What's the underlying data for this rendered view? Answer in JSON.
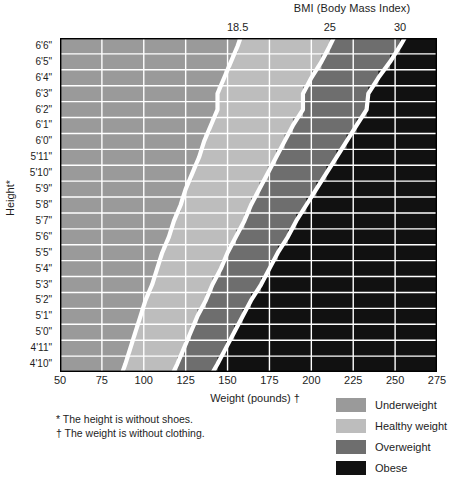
{
  "chart_data": {
    "type": "heatmap",
    "title": "BMI (Body Mass Index)",
    "xlabel": "Weight (pounds) †",
    "ylabel": "Height*",
    "xlim": [
      50,
      275
    ],
    "x_ticks": [
      50,
      75,
      100,
      125,
      150,
      175,
      200,
      225,
      250,
      275
    ],
    "x_tick_labels": [
      "50",
      "75",
      "100",
      "125",
      "150",
      "175",
      "200",
      "225",
      "250",
      "275"
    ],
    "y_tick_labels": [
      "6'6\"",
      "6'5\"",
      "6'4\"",
      "6'3\"",
      "6'2\"",
      "6'1\"",
      "6'0\"",
      "5'11\"",
      "5'10\"",
      "5'9\"",
      "5'8\"",
      "5'7\"",
      "5'6\"",
      "5'5\"",
      "5'4\"",
      "5'3\"",
      "5'2\"",
      "5'1\"",
      "5'0\"",
      "4'11\"",
      "4'10\""
    ],
    "heights_inches": [
      78,
      77,
      76,
      75,
      74,
      73,
      72,
      71,
      70,
      69,
      68,
      67,
      66,
      65,
      64,
      63,
      62,
      61,
      60,
      59,
      58
    ],
    "bmi_boundaries": [
      18.5,
      25,
      30
    ],
    "bmi_boundary_labels": [
      "18.5",
      "25",
      "30"
    ],
    "grid": true,
    "legend_position": "bottom-right",
    "categories": [
      {
        "name": "Underweight",
        "bmi_range": "< 18.5",
        "color": "#9a9a9a"
      },
      {
        "name": "Healthy weight",
        "bmi_range": "18.5 - 25",
        "color": "#bdbdbd"
      },
      {
        "name": "Overweight",
        "bmi_range": "25 - 30",
        "color": "#6e6e6e"
      },
      {
        "name": "Obese",
        "bmi_range": "≥ 30",
        "color": "#111111"
      }
    ],
    "boundary_weights_lb": [
      {
        "height": "6'6\"",
        "bmi18_5": 156,
        "bmi25": 211,
        "bmi30": 253
      },
      {
        "height": "6'5\"",
        "bmi18_5": 152,
        "bmi25": 206,
        "bmi30": 247
      },
      {
        "height": "6'4\"",
        "bmi18_5": 148,
        "bmi25": 200,
        "bmi30": 240
      },
      {
        "height": "6'3\"",
        "bmi18_5": 144,
        "bmi25": 195,
        "bmi30": 234
      },
      {
        "height": "6'2\"",
        "bmi18_5": 144,
        "bmi25": 195,
        "bmi30": 233
      },
      {
        "height": "6'1\"",
        "bmi18_5": 140,
        "bmi25": 189,
        "bmi30": 227
      },
      {
        "height": "6'0\"",
        "bmi18_5": 136,
        "bmi25": 184,
        "bmi30": 221
      },
      {
        "height": "5'11\"",
        "bmi18_5": 133,
        "bmi25": 179,
        "bmi30": 215
      },
      {
        "height": "5'10\"",
        "bmi18_5": 129,
        "bmi25": 174,
        "bmi30": 209
      },
      {
        "height": "5'9\"",
        "bmi18_5": 125,
        "bmi25": 169,
        "bmi30": 203
      },
      {
        "height": "5'8\"",
        "bmi18_5": 122,
        "bmi25": 164,
        "bmi30": 197
      },
      {
        "height": "5'7\"",
        "bmi18_5": 118,
        "bmi25": 160,
        "bmi30": 191
      },
      {
        "height": "5'6\"",
        "bmi18_5": 115,
        "bmi25": 155,
        "bmi30": 186
      },
      {
        "height": "5'5\"",
        "bmi18_5": 111,
        "bmi25": 150,
        "bmi30": 180
      },
      {
        "height": "5'4\"",
        "bmi18_5": 108,
        "bmi25": 146,
        "bmi30": 175
      },
      {
        "height": "5'3\"",
        "bmi18_5": 105,
        "bmi25": 141,
        "bmi30": 170
      },
      {
        "height": "5'2\"",
        "bmi18_5": 101,
        "bmi25": 137,
        "bmi30": 164
      },
      {
        "height": "5'1\"",
        "bmi18_5": 98,
        "bmi25": 132,
        "bmi30": 159
      },
      {
        "height": "5'0\"",
        "bmi18_5": 95,
        "bmi25": 128,
        "bmi30": 154
      },
      {
        "height": "4'11\"",
        "bmi18_5": 92,
        "bmi25": 124,
        "bmi30": 149
      },
      {
        "height": "4'10\"",
        "bmi18_5": 89,
        "bmi25": 120,
        "bmi30": 144
      }
    ]
  },
  "footnotes": {
    "height_note": "* The height is without shoes.",
    "weight_note": "† The weight is without clothing."
  },
  "colors": {
    "underweight": "#9a9a9a",
    "healthy": "#bdbdbd",
    "overweight": "#6e6e6e",
    "obese": "#111111",
    "gridline": "#ffffff",
    "boundary_line": "#ffffff",
    "text": "#1d1d1d"
  }
}
